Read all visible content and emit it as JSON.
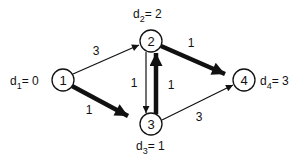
{
  "diagram": {
    "type": "directed-weighted-graph",
    "nodes": [
      {
        "id": "1",
        "label": "1",
        "distance_label": {
          "var": "d",
          "sub": "1",
          "value": "0",
          "text": "d1= 0"
        }
      },
      {
        "id": "2",
        "label": "2",
        "distance_label": {
          "var": "d",
          "sub": "2",
          "value": "2",
          "text": "d2= 2"
        }
      },
      {
        "id": "3",
        "label": "3",
        "distance_label": {
          "var": "d",
          "sub": "3",
          "value": "1",
          "text": "d3= 1"
        }
      },
      {
        "id": "4",
        "label": "4",
        "distance_label": {
          "var": "d",
          "sub": "4",
          "value": "3",
          "text": "d4= 3"
        }
      }
    ],
    "edges": [
      {
        "from": "1",
        "to": "2",
        "weight": "3",
        "bold": false
      },
      {
        "from": "1",
        "to": "3",
        "weight": "1",
        "bold": true
      },
      {
        "from": "2",
        "to": "3",
        "weight": "1",
        "bold": false
      },
      {
        "from": "3",
        "to": "2",
        "weight": "1",
        "bold": true
      },
      {
        "from": "2",
        "to": "4",
        "weight": "1",
        "bold": true
      },
      {
        "from": "3",
        "to": "4",
        "weight": "3",
        "bold": false
      }
    ],
    "colors": {
      "ink": "#111111",
      "background": "#ffffff"
    }
  }
}
